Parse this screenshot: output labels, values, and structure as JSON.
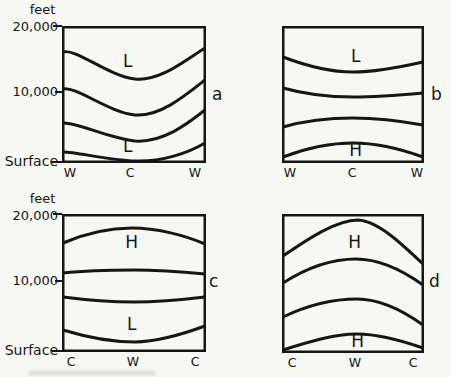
{
  "colors": {
    "ink": "#161616",
    "paper": "#f7f7f4"
  },
  "yaxis": {
    "unit_label": "feet",
    "upper_tick": "20,000",
    "mid_tick": "10,000",
    "lower_tick": "Surface"
  },
  "panels": [
    {
      "letter": "a",
      "upper_label": "L",
      "lower_label": "L",
      "x_labels": [
        "W",
        "C",
        "W"
      ]
    },
    {
      "letter": "b",
      "upper_label": "L",
      "lower_label": "H",
      "x_labels": [
        "W",
        "C",
        "W"
      ]
    },
    {
      "letter": "c",
      "upper_label": "H",
      "lower_label": "L",
      "x_labels": [
        "C",
        "W",
        "C"
      ]
    },
    {
      "letter": "d",
      "upper_label": "H",
      "lower_label": "H",
      "x_labels": [
        "C",
        "W",
        "C"
      ]
    }
  ]
}
